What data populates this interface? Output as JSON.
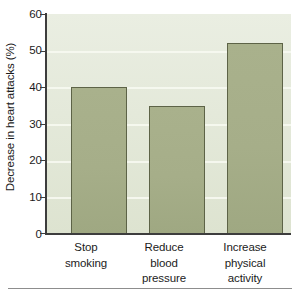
{
  "chart_data": {
    "type": "bar",
    "title": "",
    "subtitle": "",
    "xlabel": "",
    "ylabel": "Decrease in heart attacks (%)",
    "categories": [
      "Stop smoking",
      "Reduce blood pressure",
      "Increase physical activity"
    ],
    "category_lines": [
      [
        "Stop",
        "smoking"
      ],
      [
        "Reduce",
        "blood",
        "pressure"
      ],
      [
        "Increase",
        "physical",
        "activity"
      ]
    ],
    "values": [
      40,
      35,
      52
    ],
    "ylim": [
      0,
      60
    ],
    "ytick_labels": [
      "0",
      "10",
      "20",
      "30",
      "40",
      "50",
      "60"
    ],
    "ytick_values": [
      0,
      10,
      20,
      30,
      40,
      50,
      60
    ],
    "grid": true,
    "grid_axis": "y",
    "legend": "none",
    "colors": {
      "bar_fill": "#a8b08a",
      "bar_edge": "#5d6347",
      "plot_background": "#e6ebdb",
      "gridline": "#f6f8f0",
      "axis": "#3d3d3d",
      "text": "#1b1b1b",
      "rule": "#8d8d8d"
    }
  }
}
